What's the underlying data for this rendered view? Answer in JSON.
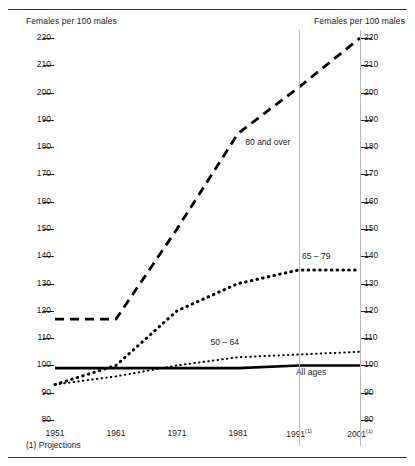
{
  "axis_caption_left": "Females per 100 males",
  "axis_caption_right": "Females per 100 males",
  "footnote": "(1) Projections",
  "chart_data": {
    "type": "line",
    "title": "",
    "xlabel": "",
    "ylabel": "Females per 100 males",
    "ylim": [
      80,
      220
    ],
    "xlim": [
      1951,
      2001
    ],
    "grid": false,
    "legend": "inline-labels",
    "yticks": [
      220,
      210,
      200,
      190,
      180,
      170,
      160,
      150,
      140,
      130,
      120,
      110,
      100,
      90,
      80
    ],
    "ytick_labels_left": [
      "220",
      "210",
      "200",
      "190",
      "180",
      "170",
      "160",
      "150",
      "140",
      "130",
      "120",
      "110",
      "100",
      "90",
      "80"
    ],
    "ytick_labels_right": [
      "220",
      "210",
      "200",
      "190",
      "180",
      "170",
      "160",
      "150",
      "140",
      "130",
      "120",
      "110",
      "100",
      "90",
      "80"
    ],
    "xticks": [
      1951,
      1961,
      1971,
      1981,
      1991,
      2001
    ],
    "xtick_labels": [
      "1951",
      "1961",
      "1971",
      "1981",
      "1991",
      "2001"
    ],
    "xtick_footnote_marks": [
      "",
      "",
      "",
      "",
      "1",
      "1"
    ],
    "reference_lines_x": [
      1991,
      2001
    ],
    "series": [
      {
        "name": "80 and over",
        "label": "80 and over",
        "style": "dashed",
        "color": "#000000",
        "x": [
          1951,
          1961,
          1971,
          1981,
          1991,
          2001
        ],
        "values": [
          117,
          117,
          150,
          185,
          202,
          220
        ]
      },
      {
        "name": "65 – 79",
        "label": "65 – 79",
        "style": "dotted-large",
        "color": "#000000",
        "x": [
          1951,
          1961,
          1971,
          1981,
          1991,
          2001
        ],
        "values": [
          93,
          100,
          120,
          130,
          135,
          135
        ]
      },
      {
        "name": "50 – 64",
        "label": "50 – 64",
        "style": "dotted-small",
        "color": "#000000",
        "x": [
          1951,
          1961,
          1971,
          1981,
          1991,
          2001
        ],
        "values": [
          93,
          96,
          100,
          103,
          104,
          105
        ]
      },
      {
        "name": "All ages",
        "label": "All ages",
        "style": "solid",
        "color": "#000000",
        "x": [
          1951,
          1961,
          1971,
          1981,
          1991,
          2001
        ],
        "values": [
          99,
          99,
          99,
          99,
          100,
          100
        ]
      }
    ],
    "series_label_positions": [
      {
        "label": "80 and over",
        "x": 1982.2,
        "y": 182
      },
      {
        "label": "65 – 79",
        "x": 1991.5,
        "y": 140
      },
      {
        "label": "50 – 64",
        "x": 1976.5,
        "y": 108.5
      },
      {
        "label": "All ages",
        "x": 1990.5,
        "y": 97.5
      }
    ]
  }
}
